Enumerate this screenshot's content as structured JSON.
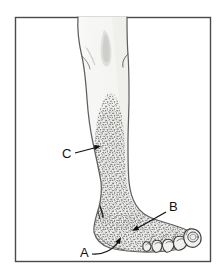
{
  "figure": {
    "kind": "anatomical-line-drawing",
    "frame": {
      "border_color": "#4a4a4a",
      "background_color": "#ffffff",
      "x": 15,
      "y": 17,
      "width": 196,
      "height": 245
    },
    "colors": {
      "outline": "#6b6b6b",
      "outline_dark": "#2b2b2b",
      "stipple": "#555555",
      "skin_fill": "#f4f4f2",
      "shadow": "#d8d8d6",
      "label_text": "#111111",
      "arrow": "#111111"
    },
    "labels": [
      {
        "id": "label-c",
        "text": "C",
        "x": 62,
        "y": 158,
        "points_to": "stippled anterolateral shin region",
        "arrow": {
          "type": "straight",
          "from_x": 74,
          "from_y": 154,
          "to_x": 100,
          "to_y": 147
        }
      },
      {
        "id": "label-b",
        "text": "B",
        "x": 172,
        "y": 211,
        "points_to": "stippled dorsum of the foot",
        "arrow": {
          "type": "straight",
          "from_x": 169,
          "from_y": 212,
          "to_x": 132,
          "to_y": 231
        }
      },
      {
        "id": "label-a",
        "text": "A",
        "x": 81,
        "y": 256,
        "points_to": "medial border / instep of the foot",
        "arrow": {
          "type": "curved",
          "from_x": 92,
          "from_y": 254,
          "to_x": 122,
          "to_y": 238
        }
      }
    ],
    "regions": [
      {
        "name": "stippled-shin",
        "description": "dense stipple over anterolateral lower leg beginning below the knee"
      },
      {
        "name": "stippled-dorsum",
        "description": "dense stipple continuing over the dorsum of the foot to the toes"
      },
      {
        "name": "unshaded-upper-leg",
        "description": "plain outlined thigh and knee above the stippled area"
      },
      {
        "name": "toes",
        "description": "five toes with nail outlines at the lower right of the foot"
      }
    ]
  }
}
